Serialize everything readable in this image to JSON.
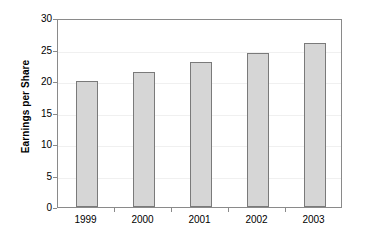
{
  "chart_data": {
    "type": "bar",
    "title": "",
    "subtitle": "",
    "xlabel": "",
    "ylabel": "Earnings per Share",
    "categories": [
      "1999",
      "2000",
      "2001",
      "2002",
      "2003"
    ],
    "values": [
      20,
      21.5,
      23,
      24.5,
      26
    ],
    "series": [
      {
        "name": "Earnings per Share",
        "values": [
          20,
          21.5,
          23,
          24.5,
          26
        ]
      }
    ],
    "ylim": [
      0,
      30
    ],
    "ytick_labels": [
      "0",
      "5",
      "10",
      "15",
      "20",
      "25",
      "30"
    ],
    "ytick_values": [
      0,
      5,
      10,
      15,
      20,
      25,
      30
    ],
    "grid": true,
    "legend": false,
    "legend_position": "none",
    "annotations": [],
    "colors": {
      "bar_fill": "#d6d6d6",
      "bar_border": "#7a7a7a",
      "axis": "#8a8a8a",
      "gridline": "#f0f0f0",
      "text": "#000000",
      "background": "#ffffff"
    }
  }
}
